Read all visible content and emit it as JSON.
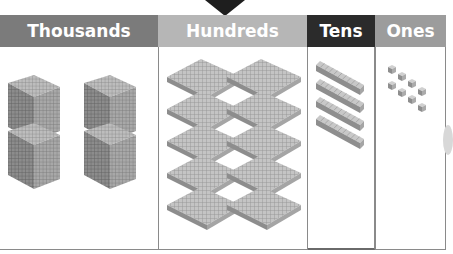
{
  "pointer": {
    "icon": "down-triangle-icon",
    "points_to": "Hundreds",
    "color": "#1e1e1e"
  },
  "columns": [
    {
      "label": "Thousands",
      "header_color": "#7b7b7b",
      "block": "thousand-cube",
      "count": 4
    },
    {
      "label": "Hundreds",
      "header_color": "#b6b6b6",
      "block": "hundred-flat",
      "count": 10
    },
    {
      "label": "Tens",
      "header_color": "#2b2b2b",
      "block": "ten-rod",
      "count": 4
    },
    {
      "label": "Ones",
      "header_color": "#9c9c9c",
      "block": "unit-cube",
      "count": 8
    }
  ],
  "border_color": "#8a8a8a"
}
